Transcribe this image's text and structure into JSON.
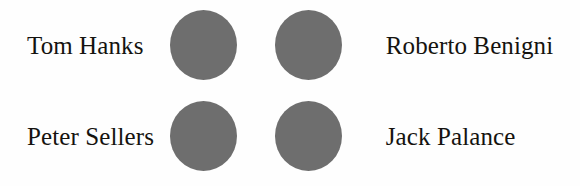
{
  "figure": {
    "background_color": "#fefefe",
    "text_color": "#15130f",
    "circle_color": "#6e6e6e",
    "rows": [
      {
        "left_label": "Tom Hanks",
        "left_face_icon": "face-circle-icon",
        "right_face_icon": "face-circle-icon",
        "right_label": "Roberto Benigni"
      },
      {
        "left_label": "Peter Sellers",
        "left_face_icon": "face-circle-icon",
        "right_face_icon": "face-circle-icon",
        "right_label": "Jack Palance"
      }
    ]
  }
}
